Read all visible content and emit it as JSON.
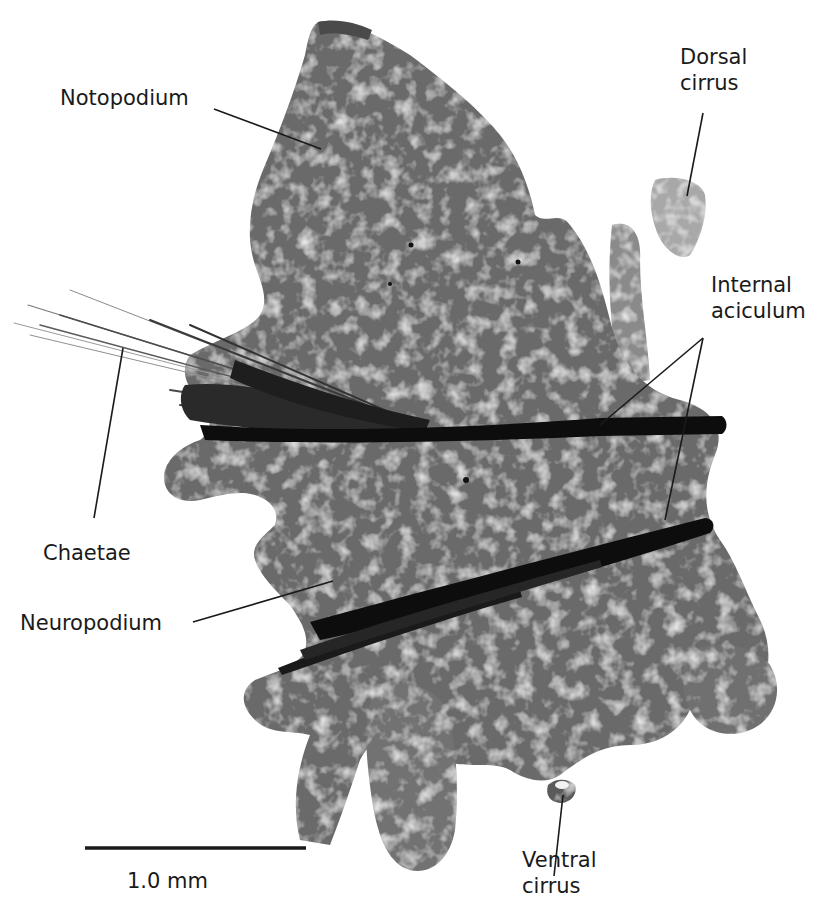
{
  "figure": {
    "labels": {
      "notopodium": "Notopodium",
      "dorsal_cirrus_line1": "Dorsal",
      "dorsal_cirrus_line2": "cirrus",
      "internal_aciculum_line1": "Internal",
      "internal_aciculum_line2": "aciculum",
      "chaetae": "Chaetae",
      "neuropodium": "Neuropodium",
      "ventral_cirrus_line1": "Ventral",
      "ventral_cirrus_line2": "cirrus"
    },
    "scale_bar": {
      "label": "1.0 mm",
      "length_px": 222
    },
    "colors": {
      "tissue": "#6e6e6e",
      "tissue_light": "#b8b8b8",
      "aciculum": "#0d0d0d",
      "text": "#1a1a1a",
      "background": "#ffffff"
    }
  }
}
